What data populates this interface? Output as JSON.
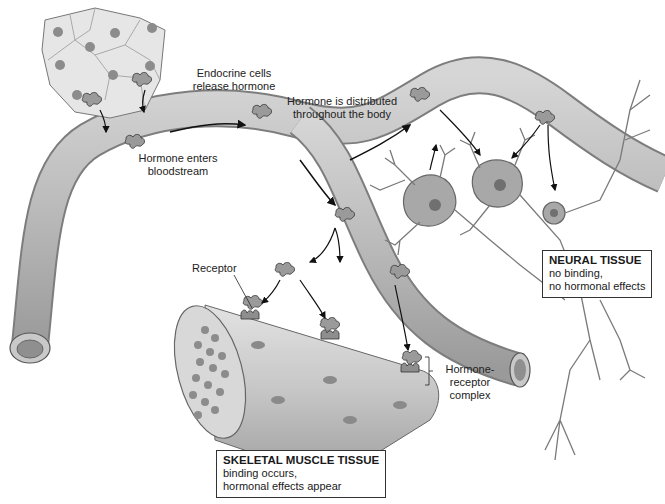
{
  "figure": {
    "labels": {
      "endocrine_cells": [
        "Endocrine cells",
        "release hormone"
      ],
      "distributed": [
        "Hormone is distributed",
        "throughout the body"
      ],
      "enters": [
        "Hormone enters",
        "bloodstream"
      ],
      "receptor": "Receptor",
      "complex": [
        "Hormone-",
        "receptor",
        "complex"
      ]
    },
    "boxes": {
      "neural": {
        "title": "NEURAL TISSUE",
        "lines": [
          "no binding,",
          "no hormonal effects"
        ]
      },
      "muscle": {
        "title": "SKELETAL MUSCLE TISSUE",
        "lines": [
          "binding occurs,",
          "hormonal effects appear"
        ]
      }
    },
    "colors": {
      "vessel": "#b9b9b9",
      "vessel_dark": "#8a8a8a",
      "cell": "#e4e4e4",
      "nucleus": "#8c8c8c",
      "hormone": "#9a9a9a",
      "neuron": "#a8a8a8",
      "muscle": "#c8c8c8",
      "outline": "#444444"
    }
  }
}
